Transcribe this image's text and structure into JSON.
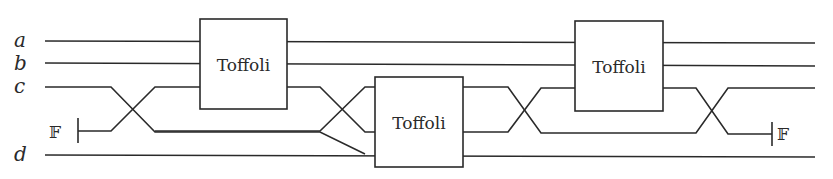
{
  "diagram": {
    "type": "reversible-circuit",
    "wire_labels": [
      "a",
      "b",
      "c",
      "d"
    ],
    "ancilla": {
      "input_label": "𝔽",
      "output_label": "𝔽"
    },
    "gates": [
      {
        "label": "Toffoli",
        "position": 1
      },
      {
        "label": "Toffoli",
        "position": 2
      },
      {
        "label": "Toffoli",
        "position": 3
      }
    ],
    "swaps": 4,
    "colors": {
      "line": "#2a2a2a",
      "background": "#ffffff"
    }
  }
}
